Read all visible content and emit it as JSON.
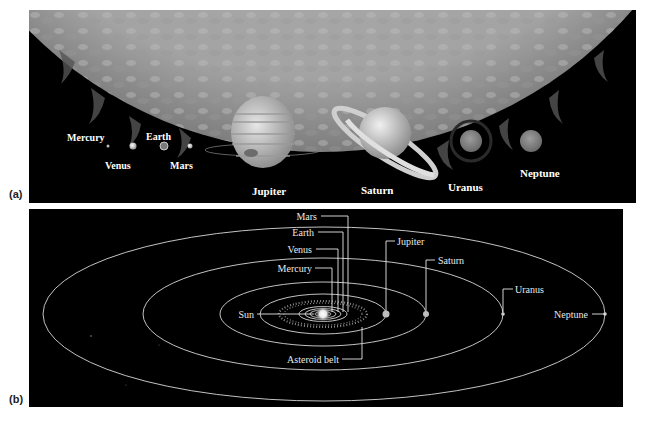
{
  "figure": {
    "panel_a": {
      "tag": "(a)",
      "title": "Relative sizes of the Sun and planets",
      "planets": [
        {
          "name": "Mercury",
          "label": "Mercury"
        },
        {
          "name": "Venus",
          "label": "Venus"
        },
        {
          "name": "Earth",
          "label": "Earth"
        },
        {
          "name": "Mars",
          "label": "Mars"
        },
        {
          "name": "Jupiter",
          "label": "Jupiter"
        },
        {
          "name": "Saturn",
          "label": "Saturn"
        },
        {
          "name": "Uranus",
          "label": "Uranus"
        },
        {
          "name": "Neptune",
          "label": "Neptune"
        }
      ]
    },
    "panel_b": {
      "tag": "(b)",
      "title": "Orbits of the planets",
      "labels": {
        "sun": "Sun",
        "mercury": "Mercury",
        "venus": "Venus",
        "earth": "Earth",
        "mars": "Mars",
        "jupiter": "Jupiter",
        "saturn": "Saturn",
        "uranus": "Uranus",
        "neptune": "Neptune",
        "asteroid_belt": "Asteroid belt"
      }
    },
    "colors": {
      "background": "#000000",
      "sun_surface": "#a9a9a9",
      "orbit_line": "#d8d8d8",
      "label_text": "#ffffff",
      "page": "#ffffff"
    }
  }
}
